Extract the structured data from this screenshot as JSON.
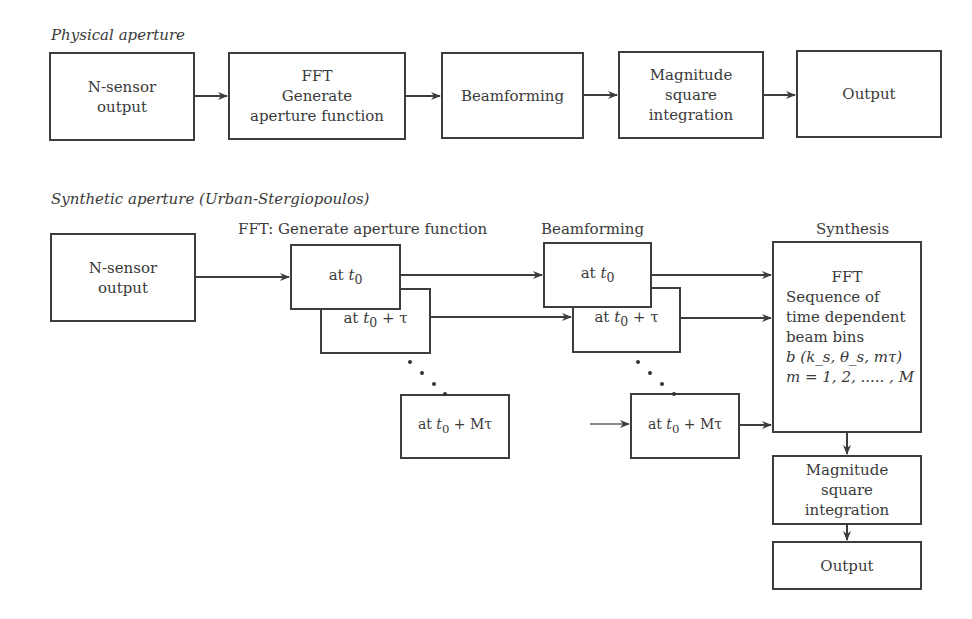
{
  "physical": {
    "title": "Physical aperture",
    "boxes": [
      {
        "lines": [
          "N-sensor",
          "output"
        ]
      },
      {
        "lines": [
          "FFT",
          "Generate",
          "aperture function"
        ]
      },
      {
        "lines": [
          "Beamforming"
        ]
      },
      {
        "lines": [
          "Magnitude",
          "square",
          "integration"
        ]
      },
      {
        "lines": [
          "Output"
        ]
      }
    ]
  },
  "synthetic": {
    "title": "Synthetic aperture (Urban-Stergiopoulos)",
    "sensor": {
      "lines": [
        "N-sensor",
        "output"
      ]
    },
    "fft_header": "FFT: Generate aperture function",
    "fft_boxes": [
      {
        "prefix": "at ",
        "var": "t",
        "sub": "0",
        "suffix": ""
      },
      {
        "prefix": "at ",
        "var": "t",
        "sub": "0",
        "suffix": " + τ"
      },
      {
        "prefix": "at ",
        "var": "t",
        "sub": "0",
        "suffix": " + Mτ"
      }
    ],
    "beam_header": "Beamforming",
    "beam_boxes": [
      {
        "prefix": "at ",
        "var": "t",
        "sub": "0",
        "suffix": ""
      },
      {
        "prefix": "at ",
        "var": "t",
        "sub": "0",
        "suffix": " + τ"
      },
      {
        "prefix": "at ",
        "var": "t",
        "sub": "0",
        "suffix": " + Mτ"
      }
    ],
    "synthesis_header": "Synthesis",
    "synthesis": {
      "title": "FFT",
      "lines": [
        "Sequence of",
        "time dependent",
        "beam bins"
      ],
      "formula": "b (k_s, θ_s, mτ)",
      "range": "m = 1, 2, ..... , M"
    },
    "magnitude": {
      "lines": [
        "Magnitude",
        "square",
        "integration"
      ]
    },
    "output": {
      "lines": [
        "Output"
      ]
    }
  }
}
